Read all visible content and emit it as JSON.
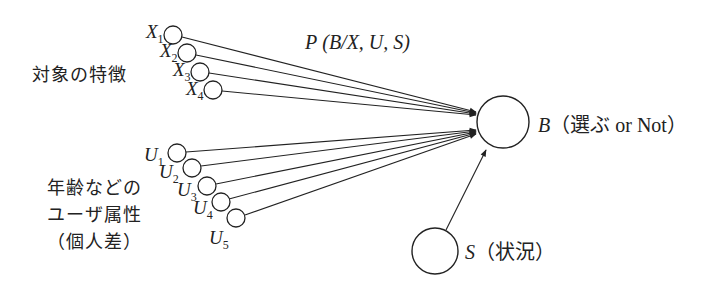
{
  "diagram": {
    "title_formula": {
      "prefix": "P",
      "args": "(B/X, U, S)"
    },
    "groups": {
      "object_features": {
        "label": "対象の特徴",
        "nodes": [
          {
            "symbol": "X",
            "index": "1"
          },
          {
            "symbol": "X",
            "index": "2"
          },
          {
            "symbol": "X",
            "index": "3"
          },
          {
            "symbol": "X",
            "index": "4"
          }
        ]
      },
      "user_attributes": {
        "label_lines": [
          "年齢などの",
          "ユーザ属性",
          "（個人差）"
        ],
        "nodes": [
          {
            "symbol": "U",
            "index": "1"
          },
          {
            "symbol": "U",
            "index": "2"
          },
          {
            "symbol": "U",
            "index": "3"
          },
          {
            "symbol": "U",
            "index": "4"
          },
          {
            "symbol": "U",
            "index": "5"
          }
        ]
      }
    },
    "output_node": {
      "symbol": "B",
      "description": "（選ぶ or Not）"
    },
    "situation_node": {
      "symbol": "S",
      "description": "（状況）"
    },
    "colors": {
      "stroke": "#222222",
      "background": "#ffffff"
    }
  }
}
